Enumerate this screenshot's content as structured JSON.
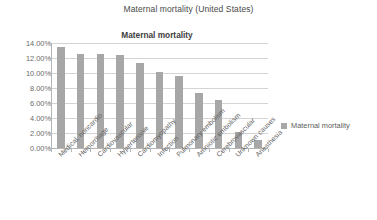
{
  "outer_title": "Maternal mortality (United States)",
  "legend": {
    "position": "right",
    "entries": [
      {
        "label": "Maternal mortality",
        "color": "#a7a7a7"
      }
    ]
  },
  "chart_data": {
    "type": "bar",
    "title": "Maternal mortality",
    "xlabel": "",
    "ylabel": "",
    "categories": [
      "Medical, noncardio",
      "Hemorrhage",
      "Cardiovascular",
      "Hypertensive",
      "Cardiomyopathy",
      "Infection",
      "Pulmonary embolism",
      "Amniotic embolism",
      "Cerebrovascular",
      "Unknown causes",
      "Anesthesia"
    ],
    "values": [
      13.5,
      12.6,
      12.5,
      12.4,
      11.3,
      10.2,
      9.6,
      7.3,
      6.4,
      2.2,
      1.1
    ],
    "value_suffix": "%",
    "series": [
      {
        "name": "Maternal mortality",
        "color": "#a7a7a7",
        "values": [
          13.5,
          12.6,
          12.5,
          12.4,
          11.3,
          10.2,
          9.6,
          7.3,
          6.4,
          2.2,
          1.1
        ]
      }
    ],
    "ylim": [
      0,
      14
    ],
    "ytick_values": [
      0,
      2,
      4,
      6,
      8,
      10,
      12,
      14
    ],
    "ytick_labels": [
      "0.00%",
      "2.00%",
      "4.00%",
      "6.00%",
      "8.00%",
      "10.00%",
      "12.00%",
      "14.00%"
    ],
    "grid": true,
    "grid_axis": "y",
    "bar_color": "#a7a7a7",
    "xtick_label_rotation": -45
  }
}
